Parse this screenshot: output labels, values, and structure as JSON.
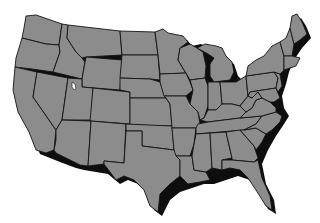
{
  "map": {
    "subject": "Contiguous United States",
    "style": "grayscale state outline map with drop shadow",
    "labels": [],
    "colors": {
      "land": "#8c8c8c",
      "border": "#141414",
      "shadow": "#0e0e0e",
      "background": "#ffffff"
    },
    "features": {
      "great_salt_lake": true,
      "state_count": 48
    }
  }
}
